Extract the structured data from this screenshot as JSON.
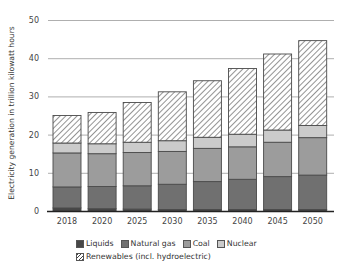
{
  "chart_data": {
    "type": "bar",
    "stacked": true,
    "title": "",
    "xlabel": "",
    "ylabel": "Electricity generation in trillion kilowatt hours",
    "ylim": [
      0,
      50
    ],
    "yticks": [
      0,
      10,
      20,
      30,
      40,
      50
    ],
    "grid": true,
    "legend_position": "bottom",
    "categories": [
      "2018",
      "2020",
      "2025",
      "2030",
      "2035",
      "2040",
      "2045",
      "2050"
    ],
    "series": [
      {
        "name": "Liquids",
        "color": "#474747",
        "pattern": "solid",
        "values": [
          0.8,
          0.6,
          0.5,
          0.4,
          0.4,
          0.4,
          0.4,
          0.4
        ]
      },
      {
        "name": "Natural gas",
        "color": "#707070",
        "pattern": "solid",
        "values": [
          5.5,
          5.8,
          6.1,
          6.6,
          7.3,
          7.9,
          8.6,
          9.0
        ]
      },
      {
        "name": "Coal",
        "color": "#9c9c9c",
        "pattern": "solid",
        "values": [
          8.9,
          8.6,
          8.7,
          8.6,
          8.7,
          8.5,
          9.0,
          9.8
        ]
      },
      {
        "name": "Nuclear",
        "color": "#cbcbcb",
        "pattern": "solid",
        "values": [
          2.6,
          2.6,
          2.7,
          2.8,
          2.9,
          3.3,
          3.2,
          3.2
        ]
      },
      {
        "name": "Renewables (incl. hydroelectric)",
        "color": "#ffffff",
        "pattern": "hatch",
        "values": [
          7.2,
          8.2,
          10.4,
          12.8,
          14.8,
          17.2,
          19.9,
          22.2
        ]
      }
    ],
    "totals": [
      25.0,
      25.8,
      28.4,
      31.2,
      34.1,
      37.3,
      41.1,
      44.6
    ]
  },
  "legend": {
    "row1": [
      {
        "label": "Liquids",
        "color": "#474747"
      },
      {
        "label": "Natural gas",
        "color": "#707070"
      },
      {
        "label": "Coal",
        "color": "#9c9c9c"
      },
      {
        "label": "Nuclear",
        "color": "#cbcbcb"
      }
    ],
    "row2": [
      {
        "label": "Renewables (incl. hydroelectric)",
        "pattern": "hatch"
      }
    ]
  }
}
